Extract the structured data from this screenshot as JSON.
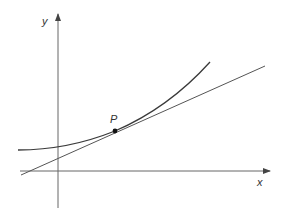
{
  "diagram": {
    "type": "tangent-to-curve",
    "axes": {
      "x_label": "x",
      "y_label": "y"
    },
    "point": {
      "label": "P"
    },
    "colors": {
      "curve": "#3a3a3a",
      "tangent": "#555555",
      "axis": "#666666",
      "point": "#111111",
      "background": "#ffffff"
    }
  }
}
